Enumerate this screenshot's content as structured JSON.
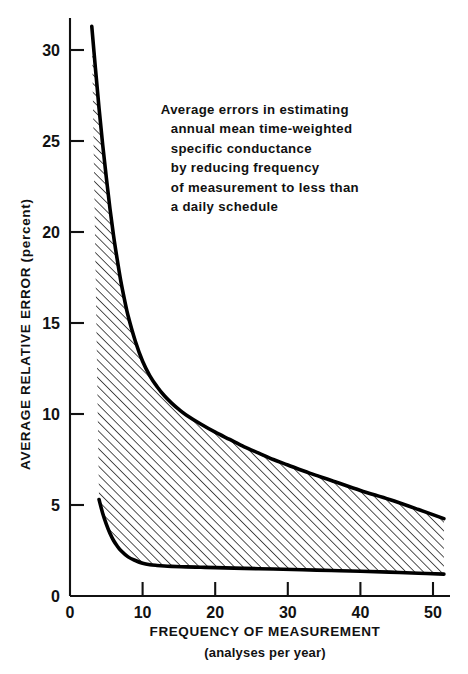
{
  "chart_data": {
    "type": "area",
    "title": "",
    "xlabel": "FREQUENCY OF MEASUREMENT",
    "xlabel_sub": "(analyses per year)",
    "ylabel": "AVERAGE RELATIVE ERROR (percent)",
    "xlim": [
      0,
      52
    ],
    "ylim": [
      0,
      32
    ],
    "xticks": [
      0,
      10,
      20,
      30,
      40,
      50
    ],
    "xtick_labels": [
      "0",
      "10",
      "20",
      "30",
      "40",
      "50"
    ],
    "yticks": [
      0,
      5,
      10,
      15,
      20,
      25,
      30
    ],
    "ytick_labels": [
      "0",
      "5",
      "10",
      "15",
      "20",
      "25",
      "30"
    ],
    "grid": false,
    "legend": "none",
    "fill_style": "diagonal-hatch",
    "annotation": {
      "lines": [
        "Average errors in estimating",
        "annual mean time-weighted",
        "specific conductance",
        "by reducing frequency",
        "of measurement to less than",
        "a daily schedule"
      ],
      "x": 12.5,
      "y": 26.5
    },
    "series": [
      {
        "name": "upper bound",
        "x": [
          3.0,
          3.5,
          4.0,
          4.5,
          5.0,
          5.5,
          6.0,
          6.5,
          7.0,
          7.5,
          8.0,
          9.0,
          10.0,
          11.0,
          12.0,
          13.0,
          14.0,
          15.0,
          16.0,
          18.0,
          20.0,
          22.0,
          24.0,
          26.0,
          28.0,
          30.0,
          33.0,
          36.0,
          40.0,
          44.0,
          48.0,
          51.5
        ],
        "y": [
          31.3,
          29.0,
          26.8,
          24.8,
          23.0,
          21.3,
          19.8,
          18.5,
          17.3,
          16.3,
          15.4,
          14.0,
          12.9,
          12.1,
          11.5,
          11.0,
          10.6,
          10.25,
          9.95,
          9.45,
          9.0,
          8.6,
          8.2,
          7.85,
          7.5,
          7.2,
          6.75,
          6.35,
          5.8,
          5.3,
          4.75,
          4.25
        ]
      },
      {
        "name": "lower bound",
        "x": [
          4.0,
          4.5,
          5.0,
          5.5,
          6.0,
          6.5,
          7.0,
          8.0,
          9.0,
          10.0,
          11.0,
          12.0,
          13.0,
          14.0,
          16.0,
          18.0,
          20.0,
          24.0,
          28.0,
          32.0,
          36.0,
          40.0,
          44.0,
          48.0,
          51.5
        ],
        "y": [
          5.3,
          4.55,
          3.95,
          3.45,
          3.05,
          2.75,
          2.5,
          2.15,
          1.95,
          1.8,
          1.72,
          1.68,
          1.65,
          1.63,
          1.6,
          1.58,
          1.56,
          1.52,
          1.48,
          1.44,
          1.4,
          1.36,
          1.31,
          1.25,
          1.2
        ]
      }
    ]
  },
  "colors": {
    "ink": "#111111",
    "background": "#ffffff",
    "curve": "#000000",
    "hatch": "#1a1a1a"
  }
}
